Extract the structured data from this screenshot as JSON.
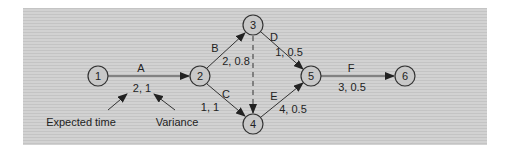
{
  "diagram": {
    "type": "PERT activity-on-arrow network",
    "colors": {
      "background": "#cccccc",
      "line": "#333333",
      "node_fill": "#c8c8c8",
      "text": "#222222"
    },
    "nodes": [
      {
        "id": "1",
        "label": "1",
        "x": 98,
        "y": 76
      },
      {
        "id": "2",
        "label": "2",
        "x": 200,
        "y": 76
      },
      {
        "id": "3",
        "label": "3",
        "x": 253,
        "y": 25
      },
      {
        "id": "4",
        "label": "4",
        "x": 253,
        "y": 124
      },
      {
        "id": "5",
        "label": "5",
        "x": 311,
        "y": 76
      },
      {
        "id": "6",
        "label": "6",
        "x": 405,
        "y": 76
      }
    ],
    "activities": [
      {
        "name": "A",
        "from": "1",
        "to": "2",
        "values": "2, 1"
      },
      {
        "name": "B",
        "from": "2",
        "to": "3",
        "values": "2, 0.8"
      },
      {
        "name": "C",
        "from": "2",
        "to": "4",
        "values": "1, 1"
      },
      {
        "name": "D",
        "from": "3",
        "to": "5",
        "values": "1, 0.5"
      },
      {
        "name": "E",
        "from": "4",
        "to": "5",
        "values": "4, 0.5"
      },
      {
        "name": "F",
        "from": "5",
        "to": "6",
        "values": "3, 0.5"
      }
    ],
    "dummy": {
      "from": "3",
      "to": "4",
      "style": "dashed"
    },
    "annotations": [
      {
        "label": "Expected time"
      },
      {
        "label": "Variance"
      }
    ]
  }
}
